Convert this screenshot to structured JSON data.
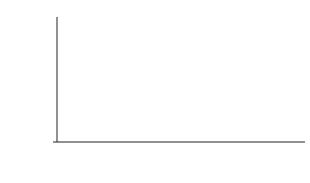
{
  "chart_data": {
    "type": "line",
    "title": "",
    "xlabel": "",
    "ylabel": "Predicted FVC (percent)",
    "ylim": [
      60,
      100
    ],
    "yticks": [
      60,
      70,
      80,
      90,
      100
    ],
    "categories": [
      "Preoperative",
      "3 months postoperative",
      "1 year postoperative"
    ],
    "category_lines": [
      [
        "Preoperative"
      ],
      [
        "3 months",
        "postoperative"
      ],
      [
        "1 year",
        "postoperative"
      ]
    ],
    "series": [
      {
        "name": "Thoracoscopic",
        "values": [
          86,
          75,
          85
        ],
        "style": "solid",
        "color": "#c8c8c8",
        "error_low": [
          81,
          71,
          77
        ],
        "error_high": [
          91,
          79,
          90
        ]
      },
      {
        "name": "Open",
        "values": [
          86,
          69,
          76
        ],
        "style": "dashed",
        "color": "#c8c8c8",
        "error_low": [
          81,
          65,
          72
        ],
        "error_high": [
          91,
          74,
          81
        ]
      }
    ],
    "annotations": [
      {
        "text": "86%",
        "category": 0,
        "position": "left"
      },
      {
        "text": "75%",
        "category": 1,
        "position": "above"
      },
      {
        "text": "69%",
        "category": 1,
        "position": "below"
      },
      {
        "text": "85%",
        "category": 2,
        "position": "above"
      },
      {
        "text": "76%",
        "category": 2,
        "position": "below"
      }
    ],
    "legend": {
      "position": "lower-left",
      "entries": [
        "Thoracoscopic",
        "Open"
      ]
    },
    "grid": false
  }
}
